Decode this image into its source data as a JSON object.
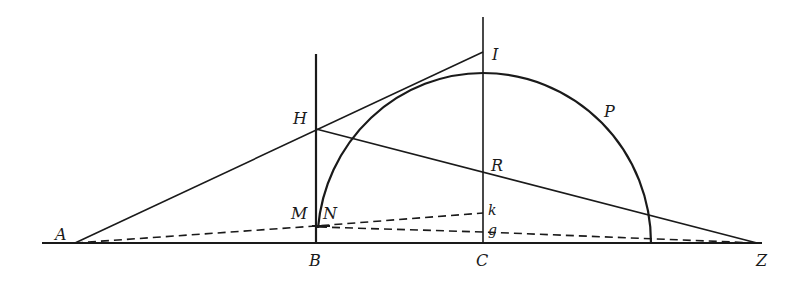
{
  "diagram": {
    "type": "geometric-construction",
    "colors": {
      "ink": "#1a1a1a",
      "background": "#ffffff"
    },
    "points": {
      "A": {
        "label": "A",
        "x": 75,
        "y": 243
      },
      "B": {
        "label": "B",
        "x": 316,
        "y": 243
      },
      "C": {
        "label": "C",
        "x": 483,
        "y": 243
      },
      "Z": {
        "label": "Z",
        "x": 757,
        "y": 243
      },
      "H": {
        "label": "H",
        "x": 316,
        "y": 129
      },
      "I": {
        "label": "I",
        "x": 483,
        "y": 52
      },
      "R": {
        "label": "R",
        "x": 483,
        "y": 173
      },
      "P": {
        "label": "P",
        "x": 604,
        "y": 112
      },
      "M": {
        "label": "M",
        "x": 316,
        "y": 226
      },
      "N": {
        "label": "N",
        "x": 319,
        "y": 227
      },
      "k": {
        "label": "k",
        "x": 483,
        "y": 213
      },
      "g": {
        "label": "g",
        "x": 483,
        "y": 232
      }
    },
    "labels": [
      "A",
      "B",
      "C",
      "Z",
      "H",
      "I",
      "R",
      "P",
      "M",
      "N",
      "k",
      "g"
    ],
    "solid_lines": [
      "baseline A–Z",
      "vertical through B",
      "vertical through C",
      "A–H–I",
      "H–R–Z"
    ],
    "dashed_lines": [
      "A–M–k",
      "N–g–Z"
    ],
    "arcs": [
      "arc N–P–(baseline) centered on C"
    ]
  }
}
